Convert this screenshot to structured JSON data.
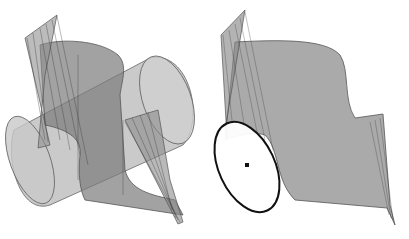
{
  "figure": {
    "panels": [
      {
        "id": "left",
        "description": "developable surface with cylinder intersecting"
      },
      {
        "id": "right",
        "description": "developable surface with ellipse and center point"
      }
    ],
    "colors": {
      "background": "#ffffff",
      "surface_fill": "#8c8c8c",
      "surface_stroke": "#555555",
      "cylinder_fill": "#b4b4b4",
      "ruling_lines": "#444444",
      "ellipse_stroke": "#111111"
    }
  }
}
